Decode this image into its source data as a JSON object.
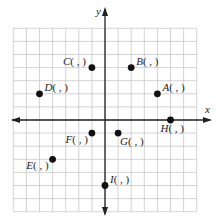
{
  "diagram": {
    "type": "coordinate-plane",
    "grid": {
      "xmin": -7,
      "xmax": 7,
      "ymin": -7,
      "ymax": 7,
      "step": 1
    },
    "axes": {
      "x_label": "x",
      "y_label": "y"
    },
    "colors": {
      "grid": "#c8c8c8",
      "axis": "#222222",
      "point": "#111111"
    },
    "points": [
      {
        "name": "A",
        "x": 4,
        "y": 2,
        "label": "A( , )",
        "label_pos": "right"
      },
      {
        "name": "B",
        "x": 2,
        "y": 4,
        "label": "B( , )",
        "label_pos": "right"
      },
      {
        "name": "C",
        "x": -1,
        "y": 4,
        "label": "C( , )",
        "label_pos": "left"
      },
      {
        "name": "D",
        "x": -5,
        "y": 2,
        "label": "D( , )",
        "label_pos": "right"
      },
      {
        "name": "E",
        "x": -4,
        "y": -3,
        "label": "E( , )",
        "label_pos": "below-left"
      },
      {
        "name": "F",
        "x": -1,
        "y": -1,
        "label": "F( , )",
        "label_pos": "below-left"
      },
      {
        "name": "G",
        "x": 1,
        "y": -1,
        "label": "G( , )",
        "label_pos": "below-right"
      },
      {
        "name": "H",
        "x": 5,
        "y": 0,
        "label": "H( , )",
        "label_pos": "below"
      },
      {
        "name": "I",
        "x": 0,
        "y": -5,
        "label": "I( , )",
        "label_pos": "right"
      }
    ]
  }
}
